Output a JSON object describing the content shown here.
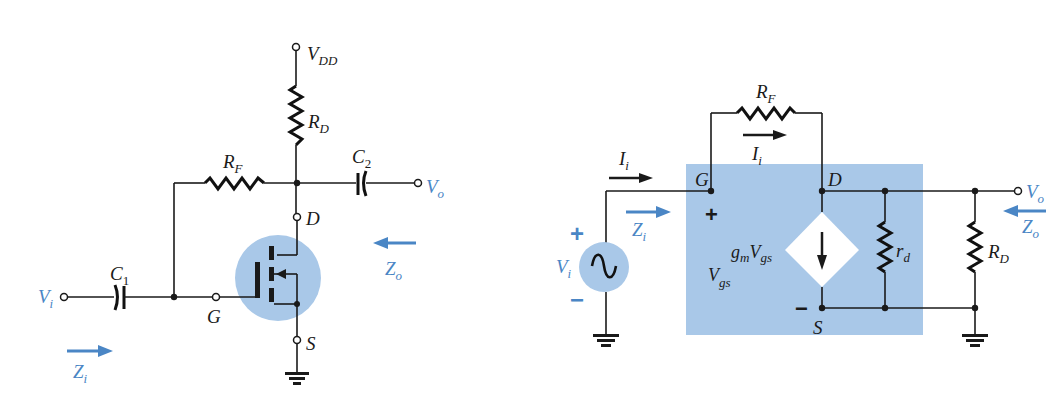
{
  "figure": {
    "left_circuit": {
      "title": "Drain-feedback E-MOSFET amplifier",
      "labels": {
        "vdd": "V",
        "vdd_sub": "DD",
        "rd": "R",
        "rd_sub": "D",
        "rf": "R",
        "rf_sub": "F",
        "c1": "C",
        "c1_sub": "1",
        "c2": "C",
        "c2_sub": "2",
        "vi": "V",
        "vi_sub": "i",
        "vo": "V",
        "vo_sub": "o",
        "d": "D",
        "g": "G",
        "s": "S",
        "zi": "Z",
        "zi_sub": "i",
        "zo": "Z",
        "zo_sub": "o"
      }
    },
    "right_circuit": {
      "title": "AC equivalent model",
      "labels": {
        "rf": "R",
        "rf_sub": "F",
        "ii_top": "I",
        "ii_top_sub": "i",
        "ii_left": "I",
        "ii_left_sub": "i",
        "g": "G",
        "d": "D",
        "s": "S",
        "plus_vgs": "+",
        "minus_vgs": "−",
        "gm": "g",
        "gm_sub": "m",
        "gm_v": "V",
        "gm_v_sub": "gs",
        "vgs": "V",
        "vgs_sub": "gs",
        "rd_small": "r",
        "rd_small_sub": "d",
        "rd": "R",
        "rd_sub": "D",
        "vi": "V",
        "vi_sub": "i",
        "vi_plus": "+",
        "vi_minus": "−",
        "vo": "V",
        "vo_sub": "o",
        "zi": "Z",
        "zi_sub": "i",
        "zo": "Z",
        "zo_sub": "o"
      }
    },
    "colors": {
      "accent_blue": "#4a86c5",
      "highlight_fill": "#a9c8e8",
      "wire": "#1a1a1a"
    }
  }
}
